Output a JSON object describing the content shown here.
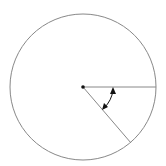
{
  "diagram": {
    "type": "circle-angle",
    "center": [
      83,
      87
    ],
    "radius": 73,
    "radius1_end": [
      156,
      87
    ],
    "radius2_end": [
      131,
      143
    ],
    "arc_radius": 30,
    "stroke_color": "#888888",
    "arrow_color": "#111111",
    "labels": []
  }
}
